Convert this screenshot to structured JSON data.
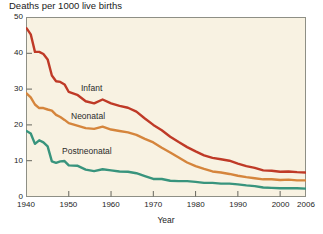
{
  "chart_data": {
    "type": "line",
    "title": "Deaths per 1000 live births",
    "xlabel": "Year",
    "ylabel": "",
    "xlim": [
      1940,
      2006
    ],
    "ylim": [
      0,
      50
    ],
    "xticks": [
      1940,
      1950,
      1960,
      1970,
      1980,
      1990,
      2000,
      2006
    ],
    "yticks": [
      0,
      10,
      20,
      30,
      40,
      50
    ],
    "grid": false,
    "legend_position": "inline-labels",
    "plot_bg_color": "#f8f2e2",
    "plot_border_color": "#8e8f85",
    "x": [
      1940,
      1941,
      1942,
      1943,
      1944,
      1945,
      1946,
      1947,
      1948,
      1949,
      1950,
      1952,
      1954,
      1956,
      1958,
      1960,
      1962,
      1964,
      1966,
      1968,
      1970,
      1972,
      1974,
      1976,
      1978,
      1980,
      1982,
      1984,
      1986,
      1988,
      1990,
      1992,
      1994,
      1996,
      1998,
      2000,
      2002,
      2004,
      2006
    ],
    "series": [
      {
        "name": "Infant",
        "color": "#bf3a27",
        "values": [
          47.0,
          45.3,
          40.4,
          40.4,
          39.8,
          38.3,
          33.8,
          32.2,
          32.0,
          31.3,
          29.2,
          28.4,
          26.6,
          26.0,
          27.1,
          26.0,
          25.3,
          24.8,
          23.7,
          21.8,
          20.0,
          18.5,
          16.7,
          15.2,
          13.8,
          12.6,
          11.5,
          10.8,
          10.4,
          10.0,
          9.2,
          8.5,
          8.0,
          7.3,
          7.2,
          6.9,
          7.0,
          6.8,
          6.7
        ]
      },
      {
        "name": "Neonatal",
        "color": "#d5853c",
        "values": [
          28.8,
          27.7,
          25.7,
          24.7,
          24.7,
          24.3,
          24.0,
          22.8,
          22.2,
          21.4,
          20.5,
          19.8,
          19.1,
          18.9,
          19.5,
          18.7,
          18.3,
          17.9,
          17.2,
          16.1,
          15.1,
          13.6,
          12.3,
          10.9,
          9.5,
          8.5,
          7.7,
          7.0,
          6.7,
          6.3,
          5.8,
          5.4,
          5.1,
          4.8,
          4.8,
          4.6,
          4.7,
          4.5,
          4.5
        ]
      },
      {
        "name": "Postneonatal",
        "color": "#38947d",
        "values": [
          18.3,
          17.6,
          14.7,
          15.7,
          15.1,
          14.0,
          9.8,
          9.4,
          9.8,
          9.9,
          8.7,
          8.6,
          7.5,
          7.1,
          7.6,
          7.3,
          7.0,
          6.9,
          6.5,
          5.7,
          4.9,
          4.9,
          4.4,
          4.3,
          4.3,
          4.1,
          3.8,
          3.8,
          3.6,
          3.6,
          3.4,
          3.1,
          2.9,
          2.5,
          2.4,
          2.3,
          2.3,
          2.3,
          2.2
        ]
      }
    ]
  }
}
